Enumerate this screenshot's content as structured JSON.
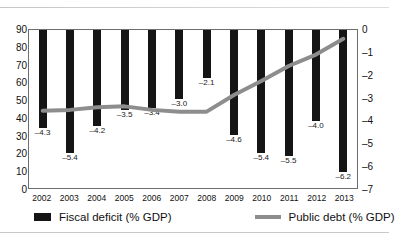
{
  "chart_data": {
    "type": "bar",
    "title": "",
    "categories": [
      "2002",
      "2003",
      "2004",
      "2005",
      "2006",
      "2007",
      "2008",
      "2009",
      "2010",
      "2011",
      "2012",
      "2013"
    ],
    "series": [
      {
        "name": "Fiscal deficit (% GDP)",
        "type": "bar",
        "axis": "right",
        "color": "#151515",
        "values": [
          -4.3,
          -5.4,
          -4.2,
          -3.5,
          -3.4,
          -3.0,
          -2.1,
          -4.6,
          -5.4,
          -5.5,
          -4.0,
          -6.2
        ],
        "labels": [
          "–4.3",
          "–5.4",
          "–4.2",
          "–3.5",
          "–3.4",
          "–3.0",
          "–2.1",
          "–4.6",
          "–5.4",
          "–5.5",
          "–4.0",
          "–6.2"
        ]
      },
      {
        "name": "Public debt (% GDP)",
        "type": "line",
        "axis": "left",
        "color": "#8d8d8d",
        "values": [
          44,
          44.5,
          46,
          46.5,
          44.5,
          43.5,
          43.5,
          53,
          61,
          69.5,
          76,
          85
        ]
      }
    ],
    "xlabel": "",
    "ylabel": "",
    "ylim": [
      0,
      90
    ],
    "y2lim": [
      -7,
      0
    ],
    "yticks": [
      "90",
      "80",
      "70",
      "60",
      "50",
      "40",
      "30",
      "20",
      "10",
      "0"
    ],
    "y2ticks": [
      "0",
      "–1",
      "–2",
      "–3",
      "–4",
      "–5",
      "–6",
      "–7"
    ],
    "grid": false,
    "legend_position": "bottom",
    "legend": [
      "Fiscal deficit (% GDP)",
      "Public debt (% GDP)"
    ]
  }
}
